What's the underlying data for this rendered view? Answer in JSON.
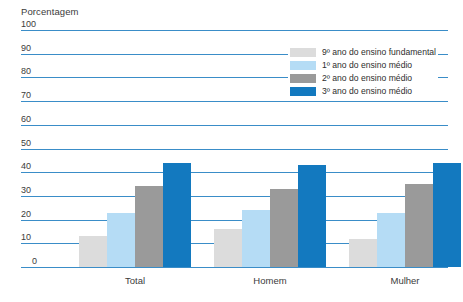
{
  "chart_data": {
    "type": "bar",
    "title": "",
    "ylabel": "Porcentagem",
    "xlabel": "",
    "categories": [
      "Total",
      "Homem",
      "Mulher"
    ],
    "ylim": [
      0,
      100
    ],
    "ytick_labels": [
      "100",
      "90",
      "80",
      "70",
      "60",
      "50",
      "40",
      "30",
      "20",
      "10",
      "0"
    ],
    "ytick_values": [
      100,
      90,
      80,
      70,
      60,
      50,
      40,
      30,
      20,
      10,
      0
    ],
    "grid": true,
    "legend_position": "top-right",
    "series": [
      {
        "name": "9º ano do ensino fundamental",
        "color": "#dcdcdc",
        "values": [
          13,
          16,
          12
        ]
      },
      {
        "name": "1º ano do ensino médio",
        "color": "#b5dcf5",
        "values": [
          23,
          24,
          23
        ]
      },
      {
        "name": "2º ano do ensino médio",
        "color": "#9a9a9a",
        "values": [
          34,
          33,
          35
        ]
      },
      {
        "name": "3º ano do ensino médio",
        "color": "#1379bf",
        "values": [
          44,
          43,
          44
        ]
      }
    ]
  },
  "colors": {
    "gridline": "#3a8dc8",
    "text": "#3b3b3b",
    "background": "#ffffff"
  }
}
